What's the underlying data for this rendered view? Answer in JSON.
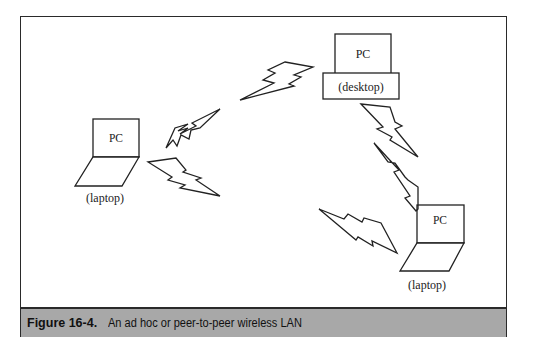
{
  "figure": {
    "number": "Figure 16-4.",
    "caption": "An ad hoc or peer-to-peer wireless LAN"
  },
  "devices": {
    "desktop": {
      "screen_label": "PC",
      "base_label": "(desktop)"
    },
    "laptop_left": {
      "screen_label": "PC",
      "caption": "(laptop)"
    },
    "laptop_right": {
      "screen_label": "PC",
      "caption": "(laptop)"
    }
  },
  "wireless_links": [
    {
      "from": "laptop_left",
      "to": "desktop",
      "icon": "lightning-bolt"
    },
    {
      "from": "desktop",
      "to": "laptop_left",
      "icon": "lightning-bolt"
    },
    {
      "from": "laptop_left",
      "to": "desktop",
      "icon": "lightning-bolt"
    },
    {
      "from": "desktop",
      "to": "laptop_right",
      "icon": "lightning-bolt"
    },
    {
      "from": "laptop_right",
      "to": "desktop",
      "icon": "lightning-bolt"
    },
    {
      "from": "laptop_right",
      "to": "laptop_left",
      "icon": "lightning-bolt"
    }
  ],
  "colors": {
    "stroke": "#222222",
    "caption_bg": "#a8a8a8",
    "background": "#ffffff"
  }
}
